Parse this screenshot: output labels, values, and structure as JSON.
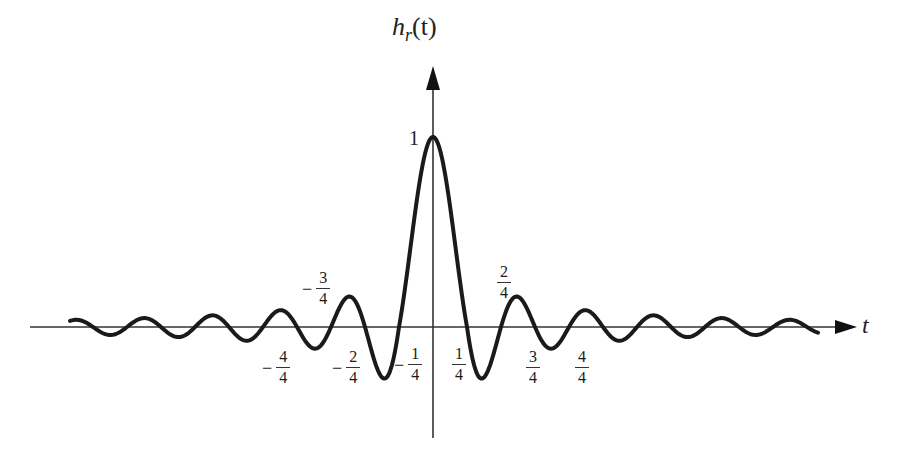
{
  "figure": {
    "type": "sinc-impulse-response-diagram",
    "y_axis_label": {
      "base": "h",
      "subscript": "r",
      "arg": "(t)"
    },
    "x_axis_label": "t",
    "peak_label": "1",
    "line_color": "#1a1a1a",
    "axis_color": "#333333",
    "annotations": [
      {
        "sign": "−",
        "num": "3",
        "den": "4",
        "position": "above-axis-left"
      },
      {
        "sign": "",
        "num": "2",
        "den": "4",
        "position": "above-axis-right"
      },
      {
        "sign": "−",
        "num": "4",
        "den": "4",
        "position": "below-axis-left"
      },
      {
        "sign": "−",
        "num": "2",
        "den": "4",
        "position": "below-axis-left"
      },
      {
        "sign": "−",
        "num": "1",
        "den": "4",
        "position": "below-axis-left"
      },
      {
        "sign": "",
        "num": "1",
        "den": "4",
        "position": "below-axis-right"
      },
      {
        "sign": "",
        "num": "3",
        "den": "4",
        "position": "below-axis-right"
      },
      {
        "sign": "",
        "num": "4",
        "den": "4",
        "position": "below-axis-right"
      }
    ]
  },
  "chart_data": {
    "type": "line",
    "title": "",
    "xlabel": "t",
    "ylabel": "h_r(t)",
    "function": "sinc-like: h_r(t) = sin(pi*t/T)/(pi*t/T), peak 1 at t=0",
    "peak": {
      "t": 0,
      "value": 1
    },
    "zero_crossing_labels": [
      "-4/4",
      "-3/4",
      "-2/4",
      "-1/4",
      "1/4",
      "2/4",
      "3/4",
      "4/4"
    ],
    "grid": false,
    "legend": null
  }
}
